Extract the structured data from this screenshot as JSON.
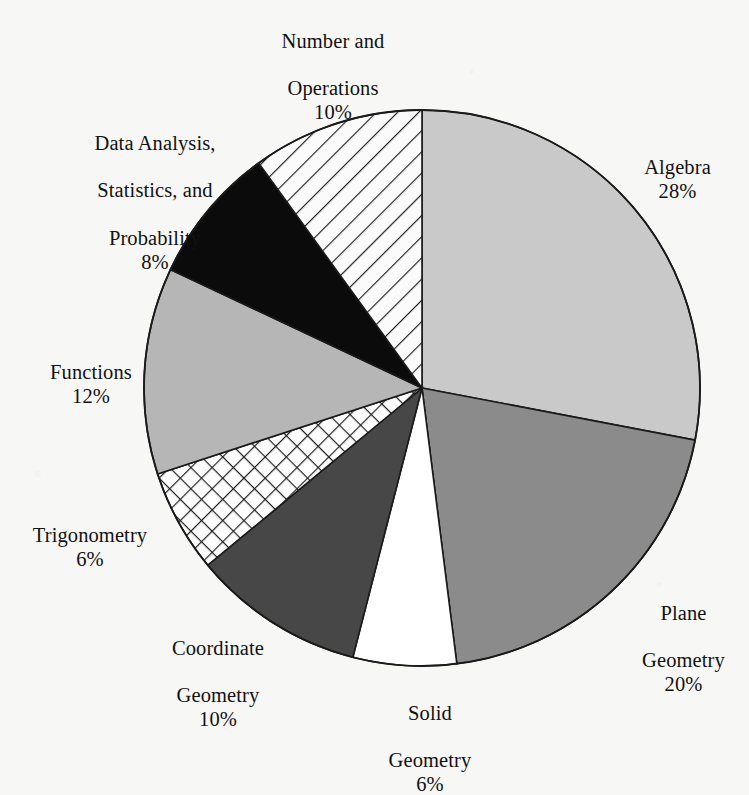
{
  "chart_data": {
    "type": "pie",
    "title": "",
    "subtitle": "",
    "xlabel": "",
    "ylabel": "",
    "legend_position": "none",
    "grid": false,
    "units": "percent",
    "total": 100,
    "start_angle_deg": 0,
    "direction": "clockwise",
    "categories": [
      "Algebra",
      "Plane Geometry",
      "Solid Geometry",
      "Coordinate Geometry",
      "Trigonometry",
      "Functions",
      "Data Analysis, Statistics, and Probability",
      "Number and Operations"
    ],
    "values": [
      28,
      20,
      6,
      10,
      6,
      12,
      8,
      10
    ],
    "slices": [
      {
        "name": "algebra",
        "label": "Algebra",
        "label_line1": "Algebra",
        "label_line2": "",
        "value": 28,
        "percent_text": "28%",
        "fill": "#c9c9c9",
        "pattern": "solid",
        "start_deg": 0,
        "end_deg": 100.8
      },
      {
        "name": "plane-geometry",
        "label": "Plane Geometry",
        "label_line1": "Plane",
        "label_line2": "Geometry",
        "value": 20,
        "percent_text": "20%",
        "fill": "#8b8b8b",
        "pattern": "solid",
        "start_deg": 100.8,
        "end_deg": 172.8
      },
      {
        "name": "solid-geometry",
        "label": "Solid Geometry",
        "label_line1": "Solid",
        "label_line2": "Geometry",
        "value": 6,
        "percent_text": "6%",
        "fill": "#ffffff",
        "pattern": "solid",
        "start_deg": 172.8,
        "end_deg": 194.4
      },
      {
        "name": "coordinate-geometry",
        "label": "Coordinate Geometry",
        "label_line1": "Coordinate",
        "label_line2": "Geometry",
        "value": 10,
        "percent_text": "10%",
        "fill": "#474747",
        "pattern": "solid",
        "start_deg": 194.4,
        "end_deg": 230.4
      },
      {
        "name": "trigonometry",
        "label": "Trigonometry",
        "label_line1": "Trigonometry",
        "label_line2": "",
        "value": 6,
        "percent_text": "6%",
        "fill": "#ffffff",
        "pattern": "crosshatch",
        "start_deg": 230.4,
        "end_deg": 252.0
      },
      {
        "name": "functions",
        "label": "Functions",
        "label_line1": "Functions",
        "label_line2": "",
        "value": 12,
        "percent_text": "12%",
        "fill": "#b6b6b6",
        "pattern": "solid",
        "start_deg": 252.0,
        "end_deg": 295.2
      },
      {
        "name": "data-analysis",
        "label": "Data Analysis, Statistics, and Probability",
        "label_line1": "Data Analysis,",
        "label_line2": "Statistics, and",
        "label_line3": "Probability",
        "value": 8,
        "percent_text": "8%",
        "fill": "#0b0b0b",
        "pattern": "solid",
        "start_deg": 295.2,
        "end_deg": 324.0
      },
      {
        "name": "number-and-operations",
        "label": "Number and Operations",
        "label_line1": "Number and",
        "label_line2": "Operations",
        "value": 10,
        "percent_text": "10%",
        "fill": "#fbfbfb",
        "pattern": "diagonal-hatch",
        "start_deg": 324.0,
        "end_deg": 360.0
      }
    ]
  },
  "geometry": {
    "center_x": 422,
    "center_y": 388,
    "radius": 278,
    "stroke": "#1a1a1a",
    "stroke_width": 1.6
  },
  "labels": {
    "number_and_operations": {
      "line1": "Number and",
      "line2": "Operations",
      "percent": "10%"
    },
    "data_analysis": {
      "line1": "Data Analysis,",
      "line2": "Statistics, and",
      "line3": "Probability",
      "percent": "8%"
    },
    "algebra": {
      "line1": "Algebra",
      "percent": "28%"
    },
    "functions": {
      "line1": "Functions",
      "percent": "12%"
    },
    "trigonometry": {
      "line1": "Trigonometry",
      "percent": "6%"
    },
    "coordinate_geometry": {
      "line1": "Coordinate",
      "line2": "Geometry",
      "percent": "10%"
    },
    "solid_geometry": {
      "line1": "Solid",
      "line2": "Geometry",
      "percent": "6%"
    },
    "plane_geometry": {
      "line1": "Plane",
      "line2": "Geometry",
      "percent": "20%"
    }
  },
  "colors": {
    "background": "#f7f7f5",
    "text": "#121212",
    "outline": "#1a1a1a",
    "algebra": "#c9c9c9",
    "plane_geometry": "#8b8b8b",
    "solid_geometry": "#ffffff",
    "coordinate_geometry": "#474747",
    "trigonometry_pattern": "#ffffff",
    "functions": "#b6b6b6",
    "data_analysis": "#0b0b0b",
    "number_operations_pattern": "#fbfbfb"
  }
}
